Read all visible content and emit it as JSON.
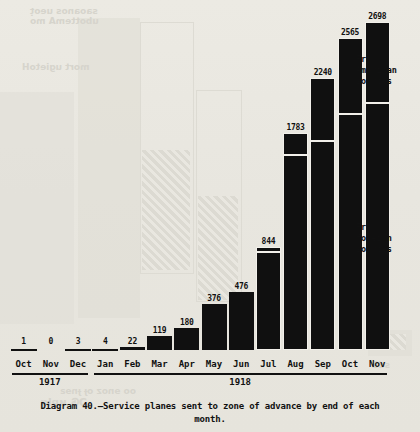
{
  "caption": {
    "line1": "Diagram 40.—Service planes sent to zone of advance by end of each",
    "line2": "month."
  },
  "annotations": {
    "american": "From\nAmerican\nsources",
    "american_line1": "From",
    "american_line2": "American",
    "american_line3": "sources",
    "foreign_line1": "From",
    "foreign_line2": "foreign",
    "foreign_line3": "sources"
  },
  "axis": {
    "years": [
      {
        "label": "1917",
        "months": [
          "Oct",
          "Nov",
          "Dec"
        ]
      },
      {
        "label": "1918",
        "months": [
          "Jan",
          "Feb",
          "Mar",
          "Apr",
          "May",
          "Jun",
          "Jul",
          "Aug",
          "Sep",
          "Oct",
          "Nov"
        ]
      }
    ]
  },
  "colors": {
    "ink": "#101010",
    "paper": "#e9e7e0",
    "label_on_dark": "#f4f2ec"
  },
  "chart_data": {
    "type": "bar",
    "title": "Diagram 40.—Service planes sent to zone of advance by end of each month.",
    "xlabel": "",
    "ylabel": "",
    "ylim": [
      0,
      2698
    ],
    "grid": false,
    "legend_position": "right",
    "stacked": true,
    "categories": [
      "Oct",
      "Nov",
      "Dec",
      "Jan",
      "Feb",
      "Mar",
      "Apr",
      "May",
      "Jun",
      "Jul",
      "Aug",
      "Sep",
      "Oct",
      "Nov"
    ],
    "category_years": [
      "1917",
      "1917",
      "1917",
      "1918",
      "1918",
      "1918",
      "1918",
      "1918",
      "1918",
      "1918",
      "1918",
      "1918",
      "1918",
      "1918"
    ],
    "values": [
      1,
      0,
      3,
      4,
      22,
      119,
      180,
      376,
      476,
      844,
      1783,
      2240,
      2565,
      2698
    ],
    "series": [
      {
        "name": "From foreign sources",
        "values": [
          1,
          0,
          3,
          4,
          22,
          119,
          180,
          376,
          476,
          810,
          1605,
          1722,
          1938,
          2031
        ]
      },
      {
        "name": "From American sources",
        "values": [
          0,
          0,
          0,
          0,
          0,
          0,
          0,
          0,
          0,
          34,
          178,
          518,
          627,
          667
        ]
      }
    ],
    "bars": [
      {
        "month": "Oct",
        "year": "1917",
        "total": 1,
        "total_label": "1",
        "foreign": 1,
        "american": null,
        "foreign_label": null,
        "american_label": null
      },
      {
        "month": "Nov",
        "year": "1917",
        "total": 0,
        "total_label": "0",
        "foreign": 0,
        "american": null,
        "foreign_label": null,
        "american_label": null
      },
      {
        "month": "Dec",
        "year": "1917",
        "total": 3,
        "total_label": "3",
        "foreign": 3,
        "american": null,
        "foreign_label": null,
        "american_label": null
      },
      {
        "month": "Jan",
        "year": "1918",
        "total": 4,
        "total_label": "4",
        "foreign": 4,
        "american": null,
        "foreign_label": null,
        "american_label": null
      },
      {
        "month": "Feb",
        "year": "1918",
        "total": 22,
        "total_label": "22",
        "foreign": 22,
        "american": null,
        "foreign_label": null,
        "american_label": null
      },
      {
        "month": "Mar",
        "year": "1918",
        "total": 119,
        "total_label": "119",
        "foreign": 119,
        "american": null,
        "foreign_label": "119",
        "american_label": null
      },
      {
        "month": "Apr",
        "year": "1918",
        "total": 180,
        "total_label": "180",
        "foreign": 180,
        "american": null,
        "foreign_label": "180",
        "american_label": null
      },
      {
        "month": "May",
        "year": "1918",
        "total": 376,
        "total_label": "376",
        "foreign": 376,
        "american": null,
        "foreign_label": "376",
        "american_label": null
      },
      {
        "month": "Jun",
        "year": "1918",
        "total": 476,
        "total_label": "476",
        "foreign": 476,
        "american": null,
        "foreign_label": "476",
        "american_label": null
      },
      {
        "month": "Jul",
        "year": "1918",
        "total": 844,
        "total_label": "844",
        "foreign": 810,
        "american": 34,
        "foreign_label": "810",
        "american_label": null
      },
      {
        "month": "Aug",
        "year": "1918",
        "total": 1783,
        "total_label": "1783",
        "foreign": 1605,
        "american": 178,
        "foreign_label": "1605",
        "american_label": "178"
      },
      {
        "month": "Sep",
        "year": "1918",
        "total": 2240,
        "total_label": "2240",
        "foreign": 1722,
        "american": 518,
        "foreign_label": "1722",
        "american_label": "518"
      },
      {
        "month": "Oct",
        "year": "1918",
        "total": 2565,
        "total_label": "2565",
        "foreign": 1938,
        "american": 627,
        "foreign_label": "1938",
        "american_label": "627"
      },
      {
        "month": "Nov",
        "year": "1918",
        "total": 2698,
        "total_label": "2698",
        "foreign": 2031,
        "american": 667,
        "foreign_label": "2031",
        "american_label": "667"
      }
    ]
  }
}
